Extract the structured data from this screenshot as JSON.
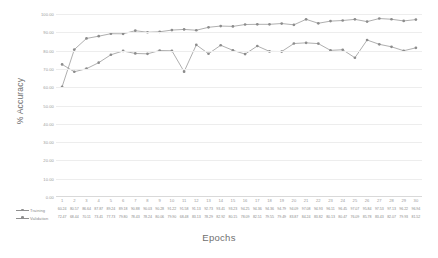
{
  "chart_data": {
    "type": "line",
    "title": "",
    "xlabel": "Epochs",
    "ylabel": "% Accuracy",
    "ylim": [
      0,
      100
    ],
    "ytick_labels": [
      "100.00",
      "90.00",
      "80.00",
      "70.00",
      "60.00",
      "50.00",
      "40.00",
      "30.00",
      "20.00",
      "10.00",
      "0.00"
    ],
    "ytick_values": [
      100,
      90,
      80,
      70,
      60,
      50,
      40,
      30,
      20,
      10,
      0
    ],
    "grid": true,
    "legend_position": "bottom-table",
    "categories": [
      1,
      2,
      3,
      4,
      5,
      6,
      7,
      8,
      9,
      10,
      11,
      12,
      13,
      14,
      15,
      16,
      17,
      18,
      19,
      20,
      21,
      22,
      23,
      24,
      25,
      26,
      27,
      28,
      29,
      30
    ],
    "series": [
      {
        "name": "Training",
        "values": [
          60.24,
          80.57,
          86.64,
          87.87,
          89.24,
          89.18,
          90.88,
          90.03,
          90.28,
          91.22,
          91.58,
          91.13,
          92.73,
          93.41,
          93.23,
          94.25,
          94.36,
          94.36,
          94.79,
          94.09,
          97.08,
          94.93,
          96.11,
          96.45,
          97.07,
          95.84,
          97.53,
          97.13,
          96.22,
          96.94
        ]
      },
      {
        "name": "Validation",
        "values": [
          72.47,
          68.44,
          70.11,
          73.41,
          77.73,
          79.8,
          78.43,
          78.24,
          80.06,
          79.9,
          68.48,
          83.13,
          78.29,
          82.92,
          80.15,
          78.09,
          82.51,
          79.55,
          79.49,
          83.87,
          84.24,
          83.82,
          80.13,
          80.47,
          76.09,
          85.78,
          83.43,
          82.07,
          79.93,
          81.52
        ]
      }
    ]
  },
  "axis": {
    "y_title": "% Accuracy",
    "x_title": "Epochs"
  },
  "legend": {
    "training_label": "Training",
    "validation_label": "Validation"
  }
}
